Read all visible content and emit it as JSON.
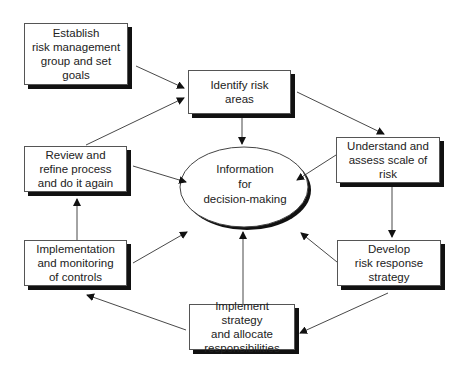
{
  "diagram": {
    "type": "cyclic process flow",
    "center": {
      "label": "Information\nfor\ndecision-making"
    },
    "nodes": [
      {
        "id": "establish",
        "label": "Establish\nrisk management\ngroup and set\ngoals"
      },
      {
        "id": "identify",
        "label": "Identify risk\nareas"
      },
      {
        "id": "understand",
        "label": "Understand and\nassess scale of\nrisk"
      },
      {
        "id": "develop",
        "label": "Develop\nrisk response\nstrategy"
      },
      {
        "id": "implement",
        "label": "Implement strategy\nand allocate\nresponsibilities"
      },
      {
        "id": "monitoring",
        "label": "Implementation\nand monitoring\nof controls"
      },
      {
        "id": "review",
        "label": "Review and\nrefine process\nand do it again"
      }
    ],
    "edges": [
      {
        "from": "establish",
        "to": "identify"
      },
      {
        "from": "identify",
        "to": "understand"
      },
      {
        "from": "understand",
        "to": "develop"
      },
      {
        "from": "develop",
        "to": "implement"
      },
      {
        "from": "implement",
        "to": "monitoring"
      },
      {
        "from": "monitoring",
        "to": "review"
      },
      {
        "from": "review",
        "to": "identify"
      },
      {
        "from": "identify",
        "to": "center"
      },
      {
        "from": "understand",
        "to": "center"
      },
      {
        "from": "develop",
        "to": "center"
      },
      {
        "from": "implement",
        "to": "center"
      },
      {
        "from": "monitoring",
        "to": "center"
      },
      {
        "from": "review",
        "to": "center"
      }
    ]
  }
}
